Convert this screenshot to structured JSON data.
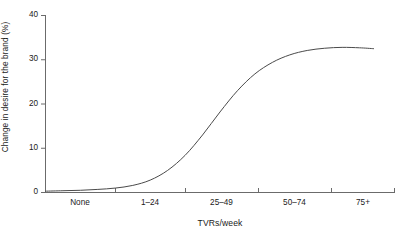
{
  "chart_data": {
    "type": "line",
    "title": "",
    "subtitle": "",
    "xlabel": "TVRs/week",
    "ylabel": "Change in desire for the brand (%)",
    "categories": [
      "None",
      "1–24",
      "25–49",
      "50–74",
      "75+"
    ],
    "xticklabels": [
      "None",
      "1–24",
      "25–49",
      "50–74",
      "75+"
    ],
    "yticklabels": [
      "0",
      "10",
      "20",
      "30",
      "40"
    ],
    "ytickvalues": [
      0,
      10,
      20,
      30,
      40
    ],
    "ylim": [
      0,
      40
    ],
    "xlim": [
      0,
      5
    ],
    "grid": false,
    "legend": false,
    "legend_position": "none",
    "series": [
      {
        "name": "Change in desire for the brand",
        "color": "#4a4a4a",
        "x": [
          0.0,
          0.25,
          0.5,
          0.75,
          1.0,
          1.25,
          1.5,
          1.75,
          2.0,
          2.25,
          2.5,
          2.75,
          3.0,
          3.25,
          3.5,
          3.75,
          4.0,
          4.25,
          4.5,
          4.7
        ],
        "values": [
          0.3,
          0.4,
          0.5,
          0.7,
          1.0,
          1.6,
          2.8,
          5.0,
          8.4,
          13.0,
          18.2,
          23.0,
          26.8,
          29.4,
          31.1,
          32.1,
          32.6,
          32.8,
          32.7,
          32.5
        ]
      }
    ],
    "annotations": []
  }
}
